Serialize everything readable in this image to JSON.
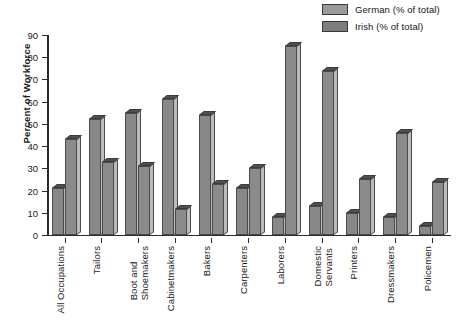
{
  "chart_data": {
    "type": "bar",
    "title": "",
    "subtitle": "",
    "xlabel": "",
    "ylabel": "Percent of Workforce",
    "ylim": [
      0,
      90
    ],
    "ytick_step": 10,
    "yticks": [
      90,
      80,
      70,
      60,
      50,
      40,
      30,
      20,
      10,
      0
    ],
    "grid": false,
    "legend_position": "top-right",
    "categories": [
      "All Occupations",
      "Tailors",
      "Boot and\nShoemakers",
      "Cabinetmakers",
      "Bakers",
      "Carpenters",
      "Laborers",
      "Domestic\nServants",
      "Printers",
      "Dressmakers",
      "Policemen"
    ],
    "series": [
      {
        "name": "German (% of total)",
        "color": "#888888",
        "values": [
          21,
          52,
          55,
          61,
          54,
          21,
          8,
          13,
          10,
          8,
          4
        ]
      },
      {
        "name": "Irish (% of total)",
        "color": "#8b8b8b",
        "values": [
          43,
          33,
          31,
          11.5,
          23,
          30,
          85,
          74,
          25,
          46,
          24
        ]
      }
    ]
  },
  "legend": {
    "items": [
      {
        "label": "German (% of total)",
        "swatch_color": "#9a9a9a"
      },
      {
        "label": "Irish (% of total)",
        "swatch_color": "#7e7e7e"
      }
    ]
  },
  "axes": {
    "y_axis_title": "Percent of Workforce"
  }
}
